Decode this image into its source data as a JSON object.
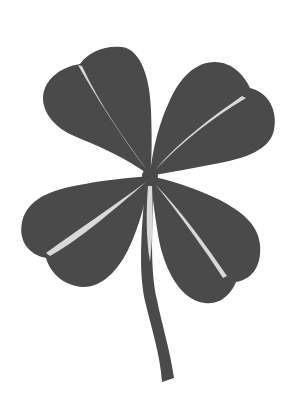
{
  "image": {
    "subject": "four-leaf clover silhouette",
    "background_color": "#ffffff",
    "leaf_color": "#4a4a4a",
    "vein_color": "#d9d9d9",
    "leaf_count": 4,
    "has_stem": true
  }
}
